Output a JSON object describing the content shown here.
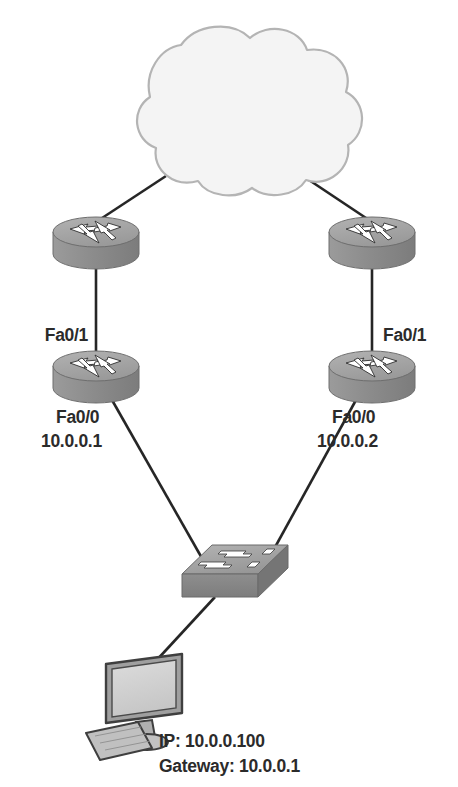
{
  "diagram": {
    "type": "network-topology",
    "background_color": "#ffffff",
    "line_color": "#262626",
    "text_color": "#2b2b2b",
    "device_fill": "#8d8d8d",
    "device_top_fill": "#a8a8a8",
    "device_edge": "#5e5e5e",
    "cloud_fill": "#f4f4f4",
    "cloud_edge": "#b5b5b5",
    "monitor_fill": "#d6d6d6",
    "monitor_edge": "#4a4a4a"
  },
  "nodes": {
    "cloud": {
      "name": "wan-cloud",
      "icon": "cloud-icon",
      "label": ""
    },
    "router_top_left": {
      "name": "router-top-left",
      "icon": "router-icon",
      "label": ""
    },
    "router_top_right": {
      "name": "router-top-right",
      "icon": "router-icon",
      "label": ""
    },
    "router_left": {
      "name": "router-left",
      "icon": "router-icon",
      "interface_uplink": "Fa0/1",
      "interface_lan": "Fa0/0",
      "ip_address": "10.0.0.1"
    },
    "router_right": {
      "name": "router-right",
      "icon": "router-icon",
      "interface_uplink": "Fa0/1",
      "interface_lan": "Fa0/0",
      "ip_address": "10.0.0.2"
    },
    "switch": {
      "name": "lan-switch",
      "icon": "switch-icon",
      "label": ""
    },
    "pc": {
      "name": "workstation-pc",
      "icon": "desktop-computer-icon",
      "ip_line": "IP: 10.0.0.100",
      "gateway_line": "Gateway: 10.0.0.1"
    }
  },
  "links": [
    {
      "name": "link-cloud-to-router-top-left",
      "from": "cloud",
      "to": "router_top_left"
    },
    {
      "name": "link-cloud-to-router-top-right",
      "from": "cloud",
      "to": "router_top_right"
    },
    {
      "name": "link-router-top-left-to-router-left",
      "from": "router_top_left",
      "to": "router_left"
    },
    {
      "name": "link-router-top-right-to-router-right",
      "from": "router_top_right",
      "to": "router_right"
    },
    {
      "name": "link-router-left-to-switch",
      "from": "router_left",
      "to": "switch"
    },
    {
      "name": "link-router-right-to-switch",
      "from": "router_right",
      "to": "switch"
    },
    {
      "name": "link-switch-to-pc",
      "from": "switch",
      "to": "pc"
    }
  ]
}
